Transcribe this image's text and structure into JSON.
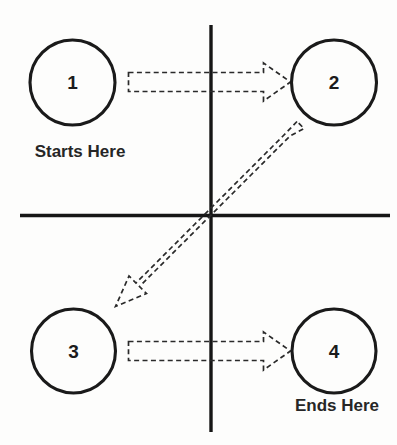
{
  "diagram": {
    "background_color": "#fdfdfc",
    "line_color": "#161616",
    "arrow_color": "#2a2a2a",
    "text_color": "#262626",
    "nodes": [
      {
        "id": "node-1",
        "label": "1",
        "cx": 72.5,
        "cy": 82.5,
        "r": 42.5,
        "quadrant": "top-left"
      },
      {
        "id": "node-2",
        "label": "2",
        "cx": 334.0,
        "cy": 82.5,
        "r": 42.5,
        "quadrant": "top-right"
      },
      {
        "id": "node-3",
        "label": "3",
        "cx": 73.5,
        "cy": 351.0,
        "r": 42.0,
        "quadrant": "bottom-left"
      },
      {
        "id": "node-4",
        "label": "4",
        "cx": 334.0,
        "cy": 351.0,
        "r": 42.0,
        "quadrant": "bottom-right"
      }
    ],
    "captions": [
      {
        "id": "caption-start",
        "text": "Starts Here",
        "x": 80,
        "y": 153
      },
      {
        "id": "caption-end",
        "text": "Ends Here",
        "x": 337,
        "y": 407
      }
    ],
    "axes": {
      "vertical": {
        "x": 211,
        "y1": 25,
        "y2": 432
      },
      "horizontal": {
        "y": 215.5,
        "x1": 20,
        "x2": 390
      }
    },
    "arrows": [
      {
        "id": "arrow-1-to-2",
        "from": "node-1",
        "to": "node-2",
        "style": "dashed-outline-block",
        "direction": "right"
      },
      {
        "id": "arrow-2-to-3",
        "from": "node-2",
        "to": "node-3",
        "style": "dashed-outline-block",
        "direction": "diagonal-down-left"
      },
      {
        "id": "arrow-3-to-4",
        "from": "node-3",
        "to": "node-4",
        "style": "dashed-outline-block",
        "direction": "right"
      }
    ],
    "sequence": [
      "1",
      "2",
      "3",
      "4"
    ]
  }
}
